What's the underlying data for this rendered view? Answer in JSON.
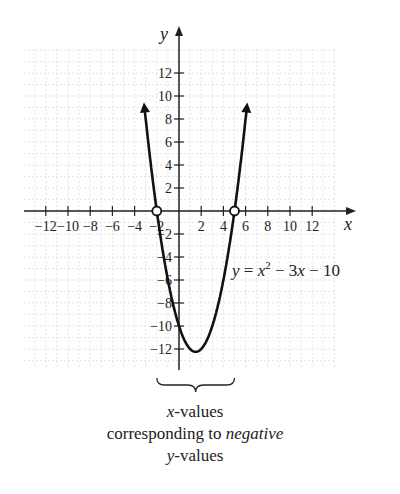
{
  "chart_data": {
    "type": "line",
    "title": "",
    "equation": "y = x² − 3x − 10",
    "equation_parts": {
      "y": "y",
      "eq": " = ",
      "x": "x",
      "sup": "2",
      "rest": " − 3x − 10"
    },
    "xlabel": "x",
    "ylabel": "y",
    "xlim": [
      -14,
      15
    ],
    "ylim": [
      -14,
      14
    ],
    "x_ticks": [
      -12,
      -10,
      -8,
      -6,
      -4,
      -2,
      2,
      4,
      6,
      8,
      10,
      12
    ],
    "y_ticks": [
      -12,
      -10,
      -8,
      -6,
      -4,
      -2,
      2,
      4,
      6,
      8,
      10,
      12
    ],
    "x_tick_labels": [
      "−12",
      "−10",
      "−8",
      "−6",
      "−4",
      "−2",
      "2",
      "4",
      "6",
      "8",
      "10",
      "12"
    ],
    "y_tick_labels": [
      "−12",
      "−10",
      "−8",
      "−6",
      "−4",
      "−2",
      "2",
      "4",
      "6",
      "8",
      "10",
      "12"
    ],
    "grid": true,
    "series": [
      {
        "name": "y = x^2 - 3x - 10",
        "function": "x^2 - 3x - 10",
        "x_range": [
          -3.1,
          6.1
        ],
        "x": [
          -3,
          -2,
          -1,
          0,
          1,
          1.5,
          2,
          3,
          4,
          5,
          6
        ],
        "y": [
          8,
          0,
          -6,
          -10,
          -12,
          -12.25,
          -12,
          -10,
          -6,
          0,
          8
        ]
      }
    ],
    "roots": [
      {
        "x": -2,
        "y": 0
      },
      {
        "x": 5,
        "y": 0
      }
    ],
    "vertex": {
      "x": 1.5,
      "y": -12.25
    },
    "annotations": [
      {
        "type": "brace",
        "from_x": -2,
        "to_x": 5,
        "text": [
          "x-values",
          "corresponding to negative",
          "y-values"
        ]
      }
    ]
  },
  "caption": {
    "line1_var": "x",
    "line1_rest": "-values",
    "line2_pre": "corresponding to ",
    "line2_em": "negative",
    "line3_var": "y",
    "line3_rest": "-values"
  },
  "colors": {
    "curve": "#111111",
    "axis": "#222222",
    "grid": "#e4e4e4",
    "text": "#222222"
  }
}
